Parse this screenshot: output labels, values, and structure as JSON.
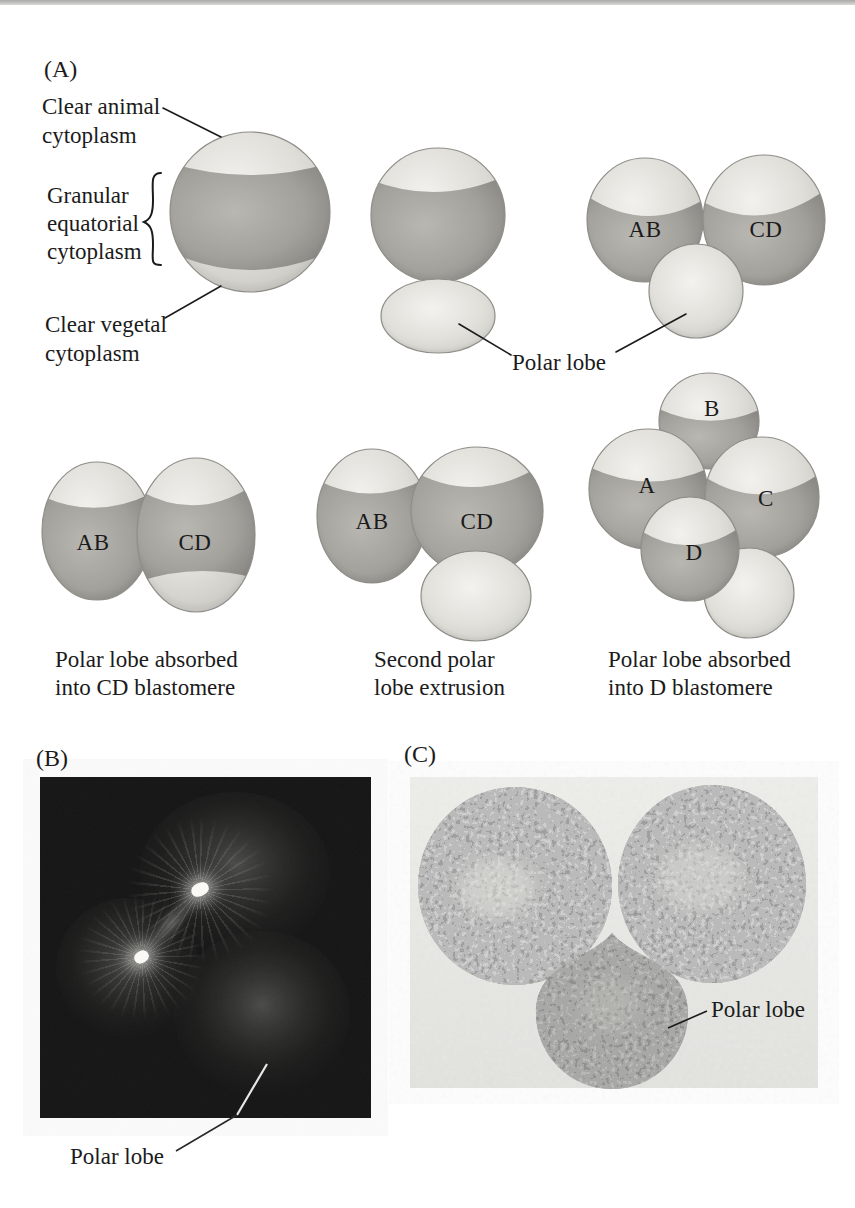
{
  "figure": {
    "panel_a": {
      "label": "(A)",
      "annotations": {
        "clear_animal": [
          "Clear animal",
          "cytoplasm"
        ],
        "granular_equatorial": [
          "Granular",
          "equatorial",
          "cytoplasm"
        ],
        "clear_vegetal": [
          "Clear vegetal",
          "cytoplasm"
        ],
        "polar_lobe": "Polar lobe"
      },
      "stage_first_cleavage": {
        "left": "AB",
        "right": "CD"
      },
      "stage_absorbed_cd": {
        "left": "AB",
        "right": "CD",
        "caption": [
          "Polar lobe absorbed",
          "into CD blastomere"
        ]
      },
      "stage_second_lobe": {
        "left": "AB",
        "right": "CD",
        "caption": [
          "Second polar",
          "lobe extrusion"
        ]
      },
      "stage_absorbed_d": {
        "a": "A",
        "b": "B",
        "c": "C",
        "d": "D",
        "caption": [
          "Polar lobe absorbed",
          "into D blastomere"
        ]
      }
    },
    "panel_b": {
      "label": "(B)",
      "annotation": "Polar lobe"
    },
    "panel_c": {
      "label": "(C)",
      "annotation": "Polar lobe"
    }
  },
  "colors": {
    "page_bg": "#ffffff",
    "cell_light": "#dfded9",
    "cell_highlight": "#f2f1ed",
    "band_center": "#a3a19c",
    "band_edge": "#7f7d79",
    "outline": "#8f8d88",
    "text": "#1b1b1b",
    "micrograph_b_bg": "#0a0a0a",
    "micrograph_c_bg": "#e9ebe6",
    "granule": "#a6a6a0"
  }
}
